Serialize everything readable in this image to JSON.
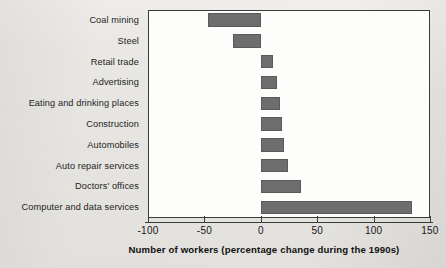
{
  "chart_data": {
    "type": "bar",
    "orientation": "horizontal",
    "title": "",
    "subtitle": "",
    "xlabel": "Number of workers (percentage change during the 1990s)",
    "ylabel": "",
    "xlim": [
      -100,
      150
    ],
    "xticks": [
      -100,
      -50,
      0,
      50,
      100,
      150
    ],
    "xticklabels": [
      "-100",
      "-50",
      "0",
      "50",
      "100",
      "150"
    ],
    "grid": false,
    "legend": null,
    "bar_color": "#6e6e6e",
    "background_color": "#e9e7e3",
    "plot_background_color": "#fdfdfc",
    "axis_color": "#3b3b3b",
    "categories": [
      "Coal mining",
      "Steel",
      "Retail trade",
      "Advertising",
      "Eating and drinking places",
      "Construction",
      "Automobiles",
      "Auto repair services",
      "Doctors' offices",
      "Computer and data services"
    ],
    "values": [
      -47,
      -25,
      11,
      14,
      17,
      19,
      21,
      24,
      36,
      134
    ]
  }
}
